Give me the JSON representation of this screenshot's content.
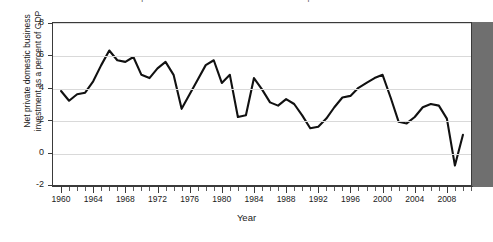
{
  "chart_data": {
    "type": "line",
    "title": "Net private domestic business investment as a percent of GDP",
    "xlabel": "Year",
    "ylabel": "Net private domestic business investment as a percent of GDP",
    "ylabel_line1": "Net private domestic business",
    "ylabel_line2": "investment as a percent of GDP",
    "xlim": [
      1959,
      2011
    ],
    "ylim": [
      -2,
      8
    ],
    "ytick_labels": [
      "8",
      "6",
      "4",
      "2",
      "0",
      "-2"
    ],
    "ytick_values": [
      8,
      6,
      4,
      2,
      0,
      -2
    ],
    "xtick_labels": [
      "1960",
      "1964",
      "1968",
      "1972",
      "1976",
      "1980",
      "1984",
      "1988",
      "1992",
      "1996",
      "2000",
      "2004",
      "2008"
    ],
    "xtick_values": [
      1960,
      1964,
      1968,
      1972,
      1976,
      1980,
      1984,
      1988,
      1992,
      1996,
      2000,
      2004,
      2008
    ],
    "grid": true,
    "legend": "none",
    "line_color": "#111111",
    "series": [
      {
        "name": "Net private domestic business investment as a percent of GDP",
        "x": [
          1960,
          1961,
          1962,
          1963,
          1964,
          1965,
          1966,
          1967,
          1968,
          1969,
          1970,
          1971,
          1972,
          1973,
          1974,
          1975,
          1976,
          1977,
          1978,
          1979,
          1980,
          1981,
          1982,
          1983,
          1984,
          1985,
          1986,
          1987,
          1988,
          1989,
          1990,
          1991,
          1992,
          1993,
          1994,
          1995,
          1996,
          1997,
          1998,
          1999,
          2000,
          2001,
          2002,
          2003,
          2004,
          2005,
          2006,
          2007,
          2008,
          2009,
          2010
        ],
        "values": [
          3.8,
          3.2,
          3.6,
          3.7,
          4.4,
          5.4,
          6.3,
          5.7,
          5.6,
          5.9,
          4.8,
          4.6,
          5.2,
          5.6,
          4.8,
          2.7,
          3.6,
          4.5,
          5.4,
          5.7,
          4.3,
          4.8,
          2.2,
          2.3,
          4.6,
          3.9,
          3.1,
          2.9,
          3.3,
          3.0,
          2.3,
          1.5,
          1.6,
          2.1,
          2.8,
          3.4,
          3.5,
          4.0,
          4.3,
          4.6,
          4.8,
          3.4,
          1.9,
          1.8,
          2.2,
          2.8,
          3.0,
          2.9,
          2.1,
          -0.8,
          1.1
        ]
      }
    ]
  }
}
